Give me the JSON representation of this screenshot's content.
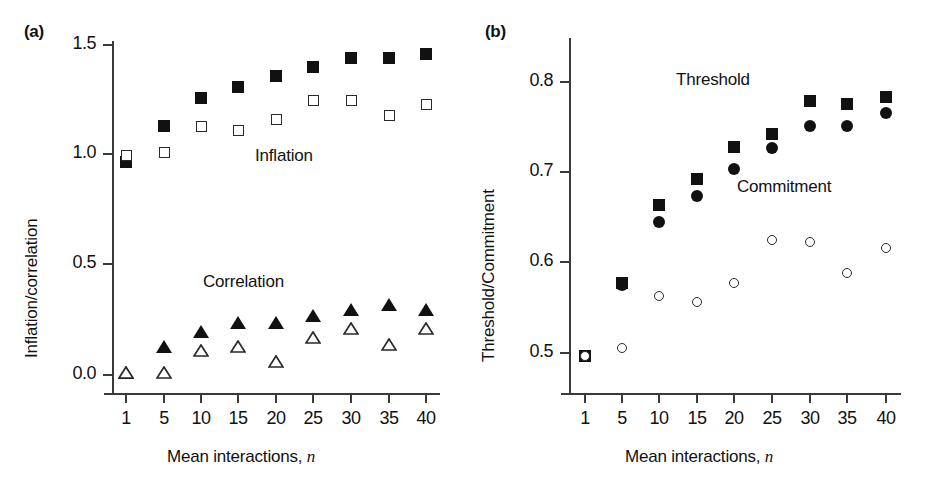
{
  "figure": {
    "panels": [
      {
        "tag": "(a)",
        "ylabel": "Inflation/correlation",
        "xlabel_main": "Mean interactions,",
        "xlabel_italic": "n",
        "annotations": [
          {
            "text": "Inflation",
            "x": 255,
            "y": 146
          },
          {
            "text": "Correlation",
            "x": 203,
            "y": 272
          }
        ]
      },
      {
        "tag": "(b)",
        "ylabel": "Threshold/Commitment",
        "xlabel_main": "Mean interactions,",
        "xlabel_italic": "n",
        "annotations": [
          {
            "text": "Threshold",
            "x": 676,
            "y": 70
          },
          {
            "text": "Commitment",
            "x": 737,
            "y": 177
          }
        ]
      }
    ]
  },
  "chart_data": [
    {
      "type": "scatter",
      "panel": "(a)",
      "title": "",
      "xlabel": "Mean interactions, n",
      "ylabel": "Inflation/correlation",
      "categories": [
        "1",
        "5",
        "10",
        "15",
        "20",
        "25",
        "30",
        "35",
        "40"
      ],
      "x": [
        1,
        5,
        10,
        15,
        20,
        25,
        30,
        35,
        40
      ],
      "ylim": [
        0.0,
        1.5
      ],
      "yticks": [
        0.0,
        0.5,
        1.0,
        1.5
      ],
      "ytick_labels": [
        "0.0",
        "0.5",
        "1.0",
        "1.5"
      ],
      "grid": false,
      "legend": "inline-annotations",
      "series": [
        {
          "name": "Inflation (filled square)",
          "marker": "filled-square",
          "values": [
            0.97,
            1.13,
            1.26,
            1.31,
            1.36,
            1.4,
            1.44,
            1.44,
            1.46
          ]
        },
        {
          "name": "Inflation (open square)",
          "marker": "open-square",
          "values": [
            1.0,
            1.01,
            1.13,
            1.11,
            1.16,
            1.25,
            1.25,
            1.18,
            1.23
          ]
        },
        {
          "name": "Correlation (filled triangle)",
          "marker": "filled-triangle",
          "values": [
            0.01,
            0.13,
            0.2,
            0.24,
            0.24,
            0.27,
            0.3,
            0.32,
            0.3
          ]
        },
        {
          "name": "Correlation (open triangle)",
          "marker": "open-triangle",
          "values": [
            0.01,
            0.01,
            0.11,
            0.13,
            0.06,
            0.17,
            0.21,
            0.14,
            0.21
          ]
        }
      ]
    },
    {
      "type": "scatter",
      "panel": "(b)",
      "title": "",
      "xlabel": "Mean interactions, n",
      "ylabel": "Threshold/Commitment",
      "categories": [
        "1",
        "5",
        "10",
        "15",
        "20",
        "25",
        "30",
        "35",
        "40"
      ],
      "x": [
        1,
        5,
        10,
        15,
        20,
        25,
        30,
        35,
        40
      ],
      "ylim": [
        0.48,
        0.81
      ],
      "yticks": [
        0.5,
        0.6,
        0.7,
        0.8
      ],
      "ytick_labels": [
        "0.5",
        "0.6",
        "0.7",
        "0.8"
      ],
      "grid": false,
      "legend": "inline-annotations",
      "series": [
        {
          "name": "Threshold (filled square)",
          "marker": "filled-square",
          "values": [
            0.497,
            0.577,
            0.664,
            0.693,
            0.728,
            0.742,
            0.779,
            0.776,
            0.783
          ]
        },
        {
          "name": "Commitment (filled circle)",
          "marker": "filled-circle",
          "values": [
            0.497,
            0.575,
            0.645,
            0.674,
            0.704,
            0.727,
            0.751,
            0.751,
            0.766
          ]
        },
        {
          "name": "Commitment (open circle)",
          "marker": "open-circle",
          "values": [
            0.497,
            0.506,
            0.563,
            0.557,
            0.577,
            0.625,
            0.623,
            0.589,
            0.616
          ]
        }
      ]
    }
  ],
  "colors": {
    "marker_fill": "#111111",
    "marker_stroke": "#2a2a2a",
    "axis": "#3a3a3a",
    "background": "#ffffff",
    "text": "#111111"
  }
}
